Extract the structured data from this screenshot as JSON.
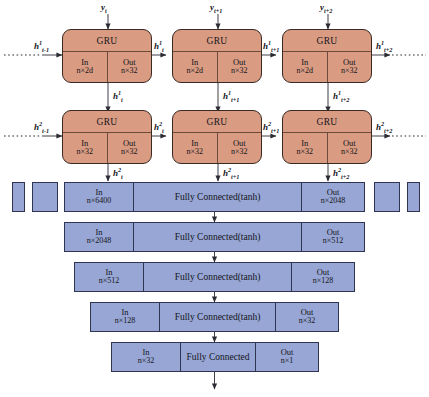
{
  "figure": {
    "type": "neural-network-architecture-diagram",
    "colors": {
      "gru_fill": "#d99b82",
      "gru_stroke": "#3a2a24",
      "fc_fill": "#97a6d4",
      "fc_stroke": "#2f3550",
      "background": "#ffffff"
    }
  },
  "gru_rows": [
    {
      "row_index": 1,
      "layer_superscript": "1",
      "cells": [
        {
          "title": "GRU",
          "in_label": "In",
          "in_dim": "n×2d",
          "out_label": "Out",
          "out_dim": "n×32",
          "top_input": "y",
          "top_input_sub": "t",
          "left_state": "h",
          "left_state_sup": "1",
          "left_state_sub": "t-1",
          "right_state": "h",
          "right_state_sup": "1",
          "right_state_sub": "t",
          "bottom_out": "h",
          "bottom_out_sup": "1",
          "bottom_out_sub": "t"
        },
        {
          "title": "GRU",
          "in_label": "In",
          "in_dim": "n×2d",
          "out_label": "Out",
          "out_dim": "n×32",
          "top_input": "y",
          "top_input_sub": "t+1",
          "right_state": "h",
          "right_state_sup": "1",
          "right_state_sub": "t+1",
          "bottom_out": "h",
          "bottom_out_sup": "1",
          "bottom_out_sub": "t+1"
        },
        {
          "title": "GRU",
          "in_label": "In",
          "in_dim": "n×2d",
          "out_label": "Out",
          "out_dim": "n×32",
          "top_input": "y",
          "top_input_sub": "t+2",
          "right_state": "h",
          "right_state_sup": "1",
          "right_state_sub": "t+2",
          "bottom_out": "h",
          "bottom_out_sup": "1",
          "bottom_out_sub": "t+2"
        }
      ]
    },
    {
      "row_index": 2,
      "layer_superscript": "2",
      "cells": [
        {
          "title": "GRU",
          "in_label": "In",
          "in_dim": "n×32",
          "out_label": "Out",
          "out_dim": "n×32",
          "left_state": "h",
          "left_state_sup": "2",
          "left_state_sub": "t-1",
          "right_state": "h",
          "right_state_sup": "2",
          "right_state_sub": "t",
          "bottom_out": "h",
          "bottom_out_sup": "2",
          "bottom_out_sub": "t"
        },
        {
          "title": "GRU",
          "in_label": "In",
          "in_dim": "n×32",
          "out_label": "Out",
          "out_dim": "n×32",
          "right_state": "h",
          "right_state_sup": "2",
          "right_state_sub": "t+1",
          "bottom_out": "h",
          "bottom_out_sup": "2",
          "bottom_out_sub": "t+1"
        },
        {
          "title": "GRU",
          "in_label": "In",
          "in_dim": "n×32",
          "out_label": "Out",
          "out_dim": "n×32",
          "right_state": "h",
          "right_state_sup": "2",
          "right_state_sub": "t+2",
          "bottom_out": "h",
          "bottom_out_sup": "2",
          "bottom_out_sub": "t+2"
        }
      ]
    }
  ],
  "fc_layers": [
    {
      "in_label": "In",
      "in_dim": "n×6400",
      "name": "Fully Connected(tanh)",
      "out_label": "Out",
      "out_dim": "n×2048"
    },
    {
      "in_label": "In",
      "in_dim": "n×2048",
      "name": "Fully Connected(tanh)",
      "out_label": "Out",
      "out_dim": "n×512"
    },
    {
      "in_label": "In",
      "in_dim": "n×512",
      "name": "Fully Connected(tanh)",
      "out_label": "Out",
      "out_dim": "n×128"
    },
    {
      "in_label": "In",
      "in_dim": "n×128",
      "name": "Fully Connected(tanh)",
      "out_label": "Out",
      "out_dim": "n×32"
    },
    {
      "in_label": "In",
      "in_dim": "n×32",
      "name": "Fully Connected",
      "out_label": "Out",
      "out_dim": "n×1"
    }
  ]
}
